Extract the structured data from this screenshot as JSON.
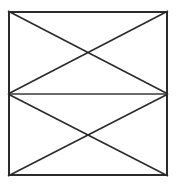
{
  "figure": {
    "canvas": {
      "width": 179,
      "height": 188,
      "background_color": "#ffffff"
    },
    "style": {
      "border_color": "#2b2b2b",
      "border_width": 2,
      "line_color": "#2b2b2b",
      "diagonal_width": 1.6,
      "midline_color": "#3a3a3a",
      "midline_width": 1.3,
      "fill_color": "#ffffff"
    },
    "rectangle": {
      "name": "outer-rectangle",
      "left": 8,
      "top": 11,
      "right": 168,
      "bottom": 176,
      "width": 160,
      "height": 165
    },
    "points": {
      "top_left": {
        "x": 8,
        "y": 11
      },
      "top_right": {
        "x": 168,
        "y": 11
      },
      "bottom_left": {
        "x": 8,
        "y": 176
      },
      "bottom_right": {
        "x": 168,
        "y": 176
      },
      "left_mid": {
        "x": 8,
        "y": 94
      },
      "right_mid": {
        "x": 168,
        "y": 94
      },
      "upper_crossing": {
        "x": 88,
        "y": 52
      },
      "lower_crossing": {
        "x": 88,
        "y": 135
      }
    },
    "segments": [
      {
        "name": "midline-horizontal",
        "description": "horizontal line across the vertical midpoint",
        "x1": 8,
        "y1": 94,
        "x2": 168,
        "y2": 94
      },
      {
        "name": "upper-diagonal-topleft-to-rightmid",
        "description": "top-left corner to right edge midpoint",
        "x1": 8,
        "y1": 11,
        "x2": 168,
        "y2": 94
      },
      {
        "name": "upper-diagonal-leftmid-to-topright",
        "description": "left edge midpoint to top-right corner",
        "x1": 8,
        "y1": 94,
        "x2": 168,
        "y2": 11
      },
      {
        "name": "lower-diagonal-leftmid-to-bottomright",
        "description": "left edge midpoint to bottom-right corner",
        "x1": 8,
        "y1": 94,
        "x2": 168,
        "y2": 176
      },
      {
        "name": "lower-diagonal-bottomleft-to-rightmid",
        "description": "bottom-left corner to right edge midpoint",
        "x1": 8,
        "y1": 176,
        "x2": 168,
        "y2": 94
      }
    ]
  }
}
